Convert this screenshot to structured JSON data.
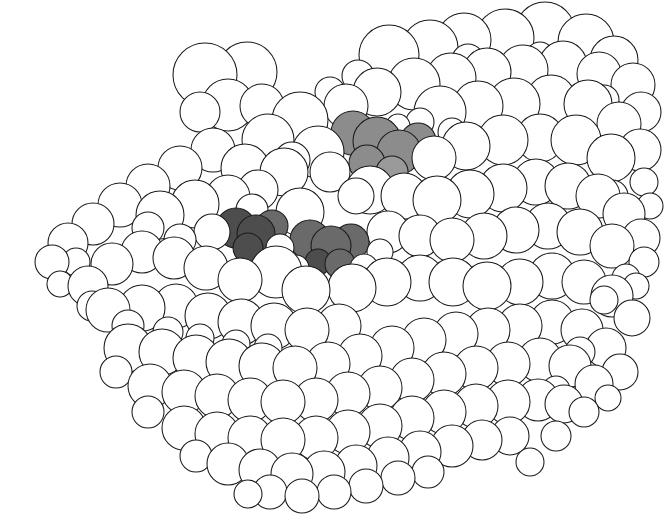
{
  "figure": {
    "kind": "space-filling-molecular-model",
    "title": "Space-filling (CPK) model of a globular protein",
    "caption": "",
    "width": 664,
    "height": 521,
    "background_color": "#ffffff",
    "outline_color": "#1a1a1a",
    "outline_width": 1.05,
    "has_text_labels": false,
    "has_axes": false,
    "has_legend": false
  },
  "palette": {
    "atom_fill_default": "#ffffff",
    "atom_fill_shaded_light": "#9a9a9a",
    "atom_fill_shaded_mid": "#8c8c8c",
    "atom_fill_shaded_dark": "#6a6a6a",
    "atom_fill_shaded_darkest": "#4d4d4d",
    "stroke": "#1a1a1a"
  },
  "shading_classes": {
    "plain": "#ffffff",
    "light": "#9a9a9a",
    "mid": "#8c8c8c",
    "dark": "#6a6a6a",
    "darkest": "#4d4d4d"
  },
  "highlight_groups": [
    {
      "name": "upper-shaded-cluster",
      "approx_center": [
        378,
        145
      ],
      "atom_count": 6,
      "tone": "mid"
    },
    {
      "name": "lower-left-shaded-cluster",
      "approx_center": [
        253,
        232
      ],
      "atom_count": 4,
      "tone": "darkest"
    },
    {
      "name": "lower-right-shaded-cluster",
      "approx_center": [
        328,
        243
      ],
      "atom_count": 5,
      "tone": "dark"
    }
  ],
  "chart_data": {
    "type": "scatter",
    "title": "Space-filling (CPK) model of a globular protein",
    "xlabel": "",
    "ylabel": "",
    "xlim": [
      0,
      664
    ],
    "ylim": [
      0,
      521
    ],
    "grid": false,
    "legend": false,
    "note": "Each datum is one van der Waals sphere: x, y (px, top-left origin), r (px radius), tone key.",
    "fields": [
      "x",
      "y",
      "r",
      "tone"
    ],
    "atoms": [
      [
        205,
        75,
        32,
        "plain"
      ],
      [
        247,
        72,
        30,
        "plain"
      ],
      [
        228,
        105,
        26,
        "plain"
      ],
      [
        262,
        106,
        22,
        "plain"
      ],
      [
        200,
        112,
        20,
        "plain"
      ],
      [
        389,
        55,
        30,
        "plain"
      ],
      [
        430,
        48,
        28,
        "plain"
      ],
      [
        464,
        40,
        27,
        "plain"
      ],
      [
        505,
        38,
        29,
        "plain"
      ],
      [
        545,
        32,
        30,
        "plain"
      ],
      [
        586,
        42,
        28,
        "plain"
      ],
      [
        614,
        60,
        24,
        "plain"
      ],
      [
        633,
        85,
        22,
        "plain"
      ],
      [
        641,
        112,
        20,
        "plain"
      ],
      [
        599,
        74,
        22,
        "plain"
      ],
      [
        563,
        65,
        24,
        "plain"
      ],
      [
        523,
        70,
        25,
        "plain"
      ],
      [
        487,
        72,
        24,
        "plain"
      ],
      [
        451,
        78,
        25,
        "plain"
      ],
      [
        414,
        84,
        26,
        "plain"
      ],
      [
        377,
        92,
        24,
        "plain"
      ],
      [
        346,
        106,
        22,
        "plain"
      ],
      [
        353,
        133,
        22,
        "mid"
      ],
      [
        377,
        141,
        24,
        "mid"
      ],
      [
        399,
        152,
        22,
        "mid"
      ],
      [
        418,
        141,
        18,
        "mid"
      ],
      [
        367,
        163,
        18,
        "mid"
      ],
      [
        392,
        172,
        16,
        "light"
      ],
      [
        440,
        112,
        26,
        "plain"
      ],
      [
        478,
        106,
        25,
        "plain"
      ],
      [
        514,
        104,
        26,
        "plain"
      ],
      [
        551,
        100,
        25,
        "plain"
      ],
      [
        588,
        104,
        24,
        "plain"
      ],
      [
        619,
        124,
        22,
        "plain"
      ],
      [
        640,
        150,
        21,
        "plain"
      ],
      [
        611,
        158,
        24,
        "plain"
      ],
      [
        576,
        140,
        25,
        "plain"
      ],
      [
        540,
        138,
        24,
        "plain"
      ],
      [
        503,
        140,
        25,
        "plain"
      ],
      [
        466,
        146,
        24,
        "plain"
      ],
      [
        434,
        158,
        22,
        "plain"
      ],
      [
        300,
        120,
        28,
        "plain"
      ],
      [
        268,
        140,
        26,
        "plain"
      ],
      [
        318,
        152,
        26,
        "plain"
      ],
      [
        284,
        172,
        24,
        "plain"
      ],
      [
        245,
        168,
        24,
        "plain"
      ],
      [
        213,
        150,
        22,
        "plain"
      ],
      [
        180,
        168,
        22,
        "plain"
      ],
      [
        148,
        186,
        22,
        "plain"
      ],
      [
        120,
        205,
        22,
        "plain"
      ],
      [
        93,
        224,
        21,
        "plain"
      ],
      [
        68,
        243,
        20,
        "plain"
      ],
      [
        52,
        262,
        17,
        "plain"
      ],
      [
        160,
        215,
        24,
        "plain"
      ],
      [
        195,
        204,
        24,
        "plain"
      ],
      [
        228,
        197,
        22,
        "plain"
      ],
      [
        258,
        190,
        20,
        "plain"
      ],
      [
        236,
        228,
        20,
        "darkest"
      ],
      [
        256,
        234,
        19,
        "darkest"
      ],
      [
        272,
        226,
        16,
        "dark"
      ],
      [
        248,
        248,
        15,
        "darkest"
      ],
      [
        310,
        240,
        20,
        "dark"
      ],
      [
        331,
        246,
        20,
        "dark"
      ],
      [
        351,
        242,
        18,
        "dark"
      ],
      [
        340,
        264,
        15,
        "dark"
      ],
      [
        318,
        262,
        13,
        "darkest"
      ],
      [
        370,
        190,
        24,
        "plain"
      ],
      [
        404,
        196,
        23,
        "plain"
      ],
      [
        437,
        200,
        24,
        "plain"
      ],
      [
        470,
        194,
        24,
        "plain"
      ],
      [
        503,
        188,
        24,
        "plain"
      ],
      [
        536,
        182,
        23,
        "plain"
      ],
      [
        568,
        186,
        23,
        "plain"
      ],
      [
        598,
        196,
        22,
        "plain"
      ],
      [
        624,
        214,
        21,
        "plain"
      ],
      [
        641,
        238,
        19,
        "plain"
      ],
      [
        612,
        246,
        22,
        "plain"
      ],
      [
        580,
        232,
        23,
        "plain"
      ],
      [
        548,
        226,
        23,
        "plain"
      ],
      [
        516,
        230,
        23,
        "plain"
      ],
      [
        484,
        236,
        23,
        "plain"
      ],
      [
        452,
        240,
        22,
        "plain"
      ],
      [
        420,
        236,
        21,
        "plain"
      ],
      [
        388,
        232,
        21,
        "plain"
      ],
      [
        352,
        288,
        24,
        "plain"
      ],
      [
        387,
        282,
        24,
        "plain"
      ],
      [
        420,
        278,
        23,
        "plain"
      ],
      [
        453,
        282,
        24,
        "plain"
      ],
      [
        487,
        286,
        24,
        "plain"
      ],
      [
        520,
        282,
        23,
        "plain"
      ],
      [
        552,
        276,
        23,
        "plain"
      ],
      [
        584,
        282,
        22,
        "plain"
      ],
      [
        612,
        296,
        21,
        "plain"
      ],
      [
        632,
        318,
        18,
        "plain"
      ],
      [
        300,
        212,
        24,
        "plain"
      ],
      [
        276,
        272,
        26,
        "plain"
      ],
      [
        306,
        290,
        24,
        "plain"
      ],
      [
        240,
        280,
        22,
        "plain"
      ],
      [
        206,
        268,
        22,
        "plain"
      ],
      [
        174,
        258,
        21,
        "plain"
      ],
      [
        142,
        252,
        21,
        "plain"
      ],
      [
        112,
        264,
        21,
        "plain"
      ],
      [
        88,
        286,
        20,
        "plain"
      ],
      [
        108,
        310,
        22,
        "plain"
      ],
      [
        142,
        308,
        23,
        "plain"
      ],
      [
        176,
        306,
        22,
        "plain"
      ],
      [
        208,
        316,
        23,
        "plain"
      ],
      [
        241,
        322,
        23,
        "plain"
      ],
      [
        274,
        326,
        23,
        "plain"
      ],
      [
        307,
        330,
        22,
        "plain"
      ],
      [
        339,
        326,
        22,
        "plain"
      ],
      [
        128,
        348,
        24,
        "plain"
      ],
      [
        162,
        352,
        23,
        "plain"
      ],
      [
        196,
        358,
        23,
        "plain"
      ],
      [
        229,
        362,
        23,
        "plain"
      ],
      [
        262,
        366,
        23,
        "plain"
      ],
      [
        295,
        368,
        22,
        "plain"
      ],
      [
        328,
        364,
        22,
        "plain"
      ],
      [
        360,
        356,
        22,
        "plain"
      ],
      [
        392,
        348,
        22,
        "plain"
      ],
      [
        424,
        340,
        22,
        "plain"
      ],
      [
        456,
        334,
        22,
        "plain"
      ],
      [
        488,
        330,
        22,
        "plain"
      ],
      [
        520,
        326,
        22,
        "plain"
      ],
      [
        552,
        322,
        22,
        "plain"
      ],
      [
        582,
        330,
        21,
        "plain"
      ],
      [
        606,
        348,
        20,
        "plain"
      ],
      [
        620,
        372,
        18,
        "plain"
      ],
      [
        150,
        386,
        22,
        "plain"
      ],
      [
        184,
        392,
        22,
        "plain"
      ],
      [
        217,
        396,
        22,
        "plain"
      ],
      [
        250,
        400,
        22,
        "plain"
      ],
      [
        283,
        402,
        22,
        "plain"
      ],
      [
        316,
        400,
        22,
        "plain"
      ],
      [
        348,
        394,
        22,
        "plain"
      ],
      [
        380,
        388,
        22,
        "plain"
      ],
      [
        412,
        380,
        22,
        "plain"
      ],
      [
        444,
        374,
        22,
        "plain"
      ],
      [
        476,
        368,
        22,
        "plain"
      ],
      [
        508,
        364,
        22,
        "plain"
      ],
      [
        540,
        360,
        22,
        "plain"
      ],
      [
        570,
        366,
        21,
        "plain"
      ],
      [
        594,
        384,
        19,
        "plain"
      ],
      [
        184,
        428,
        22,
        "plain"
      ],
      [
        217,
        434,
        22,
        "plain"
      ],
      [
        250,
        438,
        22,
        "plain"
      ],
      [
        283,
        440,
        22,
        "plain"
      ],
      [
        316,
        438,
        22,
        "plain"
      ],
      [
        348,
        432,
        22,
        "plain"
      ],
      [
        380,
        426,
        22,
        "plain"
      ],
      [
        412,
        418,
        22,
        "plain"
      ],
      [
        444,
        412,
        22,
        "plain"
      ],
      [
        476,
        406,
        22,
        "plain"
      ],
      [
        508,
        402,
        22,
        "plain"
      ],
      [
        538,
        400,
        21,
        "plain"
      ],
      [
        564,
        404,
        19,
        "plain"
      ],
      [
        228,
        464,
        21,
        "plain"
      ],
      [
        260,
        470,
        21,
        "plain"
      ],
      [
        292,
        474,
        21,
        "plain"
      ],
      [
        324,
        472,
        21,
        "plain"
      ],
      [
        356,
        466,
        21,
        "plain"
      ],
      [
        388,
        458,
        21,
        "plain"
      ],
      [
        420,
        452,
        21,
        "plain"
      ],
      [
        452,
        446,
        21,
        "plain"
      ],
      [
        482,
        440,
        20,
        "plain"
      ],
      [
        510,
        436,
        19,
        "plain"
      ],
      [
        270,
        492,
        17,
        "plain"
      ],
      [
        302,
        496,
        17,
        "plain"
      ],
      [
        334,
        492,
        17,
        "plain"
      ],
      [
        366,
        486,
        17,
        "plain"
      ],
      [
        398,
        478,
        17,
        "plain"
      ],
      [
        428,
        472,
        16,
        "plain"
      ],
      [
        330,
        172,
        20,
        "plain"
      ],
      [
        356,
        196,
        18,
        "plain"
      ],
      [
        292,
        160,
        18,
        "plain"
      ],
      [
        252,
        210,
        16,
        "plain"
      ],
      [
        212,
        232,
        18,
        "plain"
      ],
      [
        180,
        240,
        16,
        "plain"
      ],
      [
        148,
        228,
        16,
        "plain"
      ],
      [
        612,
        196,
        16,
        "plain"
      ],
      [
        644,
        182,
        14,
        "plain"
      ],
      [
        650,
        206,
        13,
        "plain"
      ],
      [
        644,
        262,
        15,
        "plain"
      ],
      [
        626,
        278,
        14,
        "plain"
      ],
      [
        76,
        262,
        14,
        "plain"
      ],
      [
        60,
        284,
        13,
        "plain"
      ],
      [
        92,
        306,
        15,
        "plain"
      ],
      [
        128,
        326,
        16,
        "plain"
      ],
      [
        468,
        60,
        16,
        "plain"
      ],
      [
        540,
        56,
        14,
        "plain"
      ],
      [
        604,
        100,
        15,
        "plain"
      ],
      [
        358,
        76,
        16,
        "plain"
      ],
      [
        330,
        92,
        15,
        "plain"
      ],
      [
        420,
        122,
        14,
        "plain"
      ],
      [
        452,
        132,
        14,
        "plain"
      ],
      [
        398,
        126,
        12,
        "plain"
      ],
      [
        280,
        248,
        14,
        "plain"
      ],
      [
        296,
        268,
        13,
        "plain"
      ],
      [
        364,
        268,
        14,
        "plain"
      ],
      [
        380,
        252,
        13,
        "plain"
      ],
      [
        168,
        332,
        15,
        "plain"
      ],
      [
        200,
        338,
        14,
        "plain"
      ],
      [
        236,
        344,
        14,
        "plain"
      ],
      [
        268,
        348,
        14,
        "plain"
      ],
      [
        116,
        372,
        16,
        "plain"
      ],
      [
        148,
        412,
        16,
        "plain"
      ],
      [
        196,
        456,
        16,
        "plain"
      ],
      [
        248,
        494,
        14,
        "plain"
      ],
      [
        556,
        436,
        15,
        "plain"
      ],
      [
        530,
        462,
        14,
        "plain"
      ],
      [
        584,
        412,
        15,
        "plain"
      ],
      [
        608,
        398,
        13,
        "plain"
      ],
      [
        604,
        300,
        14,
        "plain"
      ],
      [
        636,
        286,
        13,
        "plain"
      ],
      [
        580,
        352,
        15,
        "plain"
      ],
      [
        556,
        390,
        14,
        "plain"
      ]
    ]
  }
}
